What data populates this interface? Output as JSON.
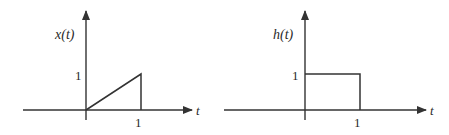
{
  "diagram": {
    "type": "signal-plots",
    "plots": [
      {
        "id": "x",
        "ylabel": "x(t)",
        "xlabel": "t",
        "ytick_label": "1",
        "xtick_label": "1",
        "shape": "ramp",
        "description": "Ramp from (0,0) to (1,1), then drops to 0 at t=1",
        "points": [
          [
            0,
            0
          ],
          [
            1,
            1
          ],
          [
            1,
            0
          ]
        ]
      },
      {
        "id": "h",
        "ylabel": "h(t)",
        "xlabel": "t",
        "ytick_label": "1",
        "xtick_label": "1",
        "shape": "rectangular-pulse",
        "description": "Unit rectangular pulse of height 1 from t=0 to t=1",
        "points": [
          [
            0,
            0
          ],
          [
            0,
            1
          ],
          [
            1,
            1
          ],
          [
            1,
            0
          ]
        ]
      }
    ]
  },
  "colors": {
    "line": "#333333",
    "background": "#ffffff"
  }
}
